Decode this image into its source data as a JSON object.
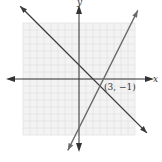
{
  "chart_data": {
    "type": "line",
    "title": "",
    "xlabel": "x",
    "ylabel": "y",
    "xlim": [
      -8,
      8
    ],
    "ylim": [
      -8,
      8
    ],
    "grid": true,
    "series": [
      {
        "name": "y = -x + 2",
        "slope": -1,
        "intercept": 2,
        "x": [
          -8.4,
          9.7
        ],
        "y": [
          10.4,
          -7.7
        ]
      },
      {
        "name": "y = 2x - 7",
        "slope": 2,
        "intercept": -7,
        "x": [
          -1.6,
          8.4
        ],
        "y": [
          -10.2,
          9.8
        ]
      }
    ],
    "annotations": [
      {
        "text": "(3, −1)",
        "x": 3,
        "y": -1
      }
    ]
  },
  "labels": {
    "x_axis": "x",
    "y_axis": "y",
    "point": "(3, −1)"
  },
  "colors": {
    "grid": "#e2e2e2",
    "grid_bg": "#f3f3f3",
    "axis": "#333333",
    "line1": "#3a3a3a",
    "line2": "#6a6a6a"
  }
}
